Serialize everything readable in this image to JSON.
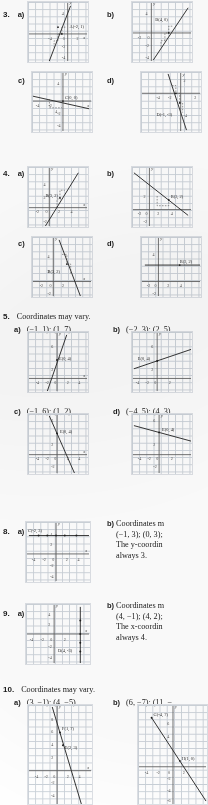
{
  "page": {
    "type": "textbook-answer-key",
    "columns": 2,
    "note": "scanned answer key; right column text is clipped at page edge"
  },
  "items": [
    {
      "number": "3.",
      "parts": [
        {
          "label": "a)",
          "graph": {
            "point_label": "A(-2, 1)",
            "x_ticks": [
              "-4",
              "-2",
              "0",
              "2"
            ],
            "y_ticks": [
              "4",
              "2",
              "-2",
              "-4"
            ],
            "rise_run": [
              "3",
              "1",
              "1"
            ]
          }
        },
        {
          "label": "b)",
          "graph": {
            "point_label": "B(4, 0)",
            "x_ticks": [
              "-2",
              "0"
            ],
            "y_ticks": [
              "4",
              "2",
              "-2",
              "-4"
            ],
            "rise_run": [
              "2",
              "1",
              "1"
            ]
          }
        },
        {
          "label": "c)",
          "graph": {
            "point_label": "C(0, 0)",
            "x_ticks": [
              "-4",
              "-2",
              "4"
            ],
            "y_ticks": [
              "4",
              "2",
              "-2",
              "-4"
            ],
            "rise_run": [
              "4",
              "1"
            ]
          }
        },
        {
          "label": "d)",
          "graph": {
            "point_label": "D(-1, -3)",
            "x_ticks": [
              "-4",
              "-2",
              "2"
            ],
            "y_ticks": [
              "2",
              "-2",
              "-4"
            ],
            "rise_run": [
              "1",
              "1",
              "1"
            ]
          }
        }
      ]
    },
    {
      "number": "4.",
      "parts": [
        {
          "label": "a)",
          "graph": {
            "point_label": "B(3, 2)",
            "x_ticks": [
              "-2",
              "0",
              "2",
              "4"
            ],
            "y_ticks": [
              "4",
              "2",
              "-2"
            ],
            "rise_run": [
              "3",
              "2",
              "2"
            ]
          }
        },
        {
          "label": "b)",
          "graph": {
            "point_label": "B(3, 2)",
            "x_ticks": [
              "-2",
              "0",
              "2",
              "4"
            ],
            "y_ticks": [
              "2",
              "-2"
            ],
            "rise_run": [
              "2",
              "3"
            ]
          }
        },
        {
          "label": "c)",
          "graph": {
            "point_label": "B(3, 2)",
            "x_ticks": [
              "-2",
              "0",
              "2"
            ],
            "y_ticks": [
              "4",
              "2",
              "-2"
            ],
            "rise_run": [
              "1",
              "-3",
              "1",
              "-3"
            ]
          }
        },
        {
          "label": "d)",
          "graph": {
            "point_label": "B(3, 2)",
            "x_ticks": [
              "-2",
              "0",
              "2",
              "4"
            ],
            "y_ticks": [
              "4",
              "-2"
            ],
            "rise_run": []
          }
        }
      ]
    },
    {
      "number": "5.",
      "heading": "Coordinates may vary.",
      "parts": [
        {
          "label": "a)",
          "answer": "(−1, 1); (1, 7)",
          "graph": {
            "point_label": "E(0, 4)",
            "x_ticks": [
              "-4",
              "-2",
              "0",
              "2",
              "4"
            ],
            "y_ticks": [
              "6",
              "2"
            ]
          }
        },
        {
          "label": "b)",
          "answer": "(−2, 3); (2, 5)",
          "graph": {
            "point_label": "E(0, 4)",
            "x_ticks": [
              "-4",
              "-2",
              "0",
              "2"
            ],
            "y_ticks": [
              "6",
              "2"
            ]
          }
        },
        {
          "label": "c)",
          "answer": "(−1, 6); (1, 2)",
          "graph": {
            "point_label": "E(0, 4)",
            "x_ticks": [
              "-4",
              "-2",
              "0",
              "2",
              "4"
            ],
            "y_ticks": [
              "6",
              "2",
              "-2"
            ]
          }
        },
        {
          "label": "d)",
          "answer": "(−4, 5); (4, 3)",
          "graph": {
            "point_label": "E(0, 4)",
            "x_ticks": [
              "-4",
              "-2",
              "0",
              "2"
            ],
            "y_ticks": [
              "6",
              "2",
              "-2"
            ]
          }
        }
      ]
    },
    {
      "number": "8.",
      "parts": [
        {
          "label": "a)",
          "graph": {
            "point_label": "C(-2, 3)",
            "x_ticks": [
              "-4",
              "-2",
              "0",
              "2",
              "4"
            ],
            "y_ticks": [
              "4",
              "2",
              "-2",
              "-4"
            ]
          }
        },
        {
          "label": "b)",
          "lines": [
            "Coordinates m",
            "(−1, 3); (0, 3);",
            "The y-coordin",
            "always 3."
          ]
        }
      ]
    },
    {
      "number": "9.",
      "parts": [
        {
          "label": "a)",
          "graph": {
            "point_label": "D(4, -3)",
            "x_ticks": [
              "-4",
              "-2",
              "0",
              "2"
            ],
            "y_ticks": [
              "4",
              "2",
              "-2",
              "-4"
            ]
          }
        },
        {
          "label": "b)",
          "lines": [
            "Coordinates m",
            "(4, −1); (4, 2);",
            "The x-coordin",
            "always 4."
          ]
        }
      ]
    },
    {
      "number": "10.",
      "heading": "Coordinates may vary.",
      "parts": [
        {
          "label": "a)",
          "answer": "(3, −1); (4, −5)",
          "graph": {
            "point_labels": [
              "F(1, 7)",
              "E(2, 3)"
            ],
            "x_ticks": [
              "-4",
              "-2",
              "0",
              "2",
              "4"
            ],
            "y_ticks": [
              "8",
              "6",
              "4",
              "2",
              "-2",
              "-4"
            ]
          }
        },
        {
          "label": "b)",
          "answer": "(6, −7); (11, −",
          "graph": {
            "point_labels": [
              "G(-4, 7)",
              "H(1, 0)"
            ],
            "x_ticks": [
              "-4",
              "-2",
              "0",
              "2"
            ],
            "y_ticks": [
              "6",
              "4",
              "-2",
              "-4",
              "-6"
            ]
          }
        }
      ]
    }
  ]
}
